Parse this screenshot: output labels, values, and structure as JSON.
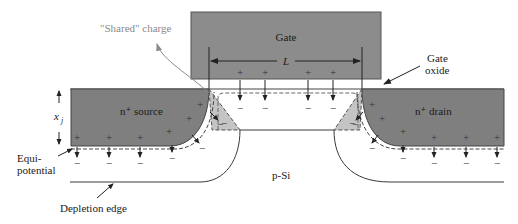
{
  "figure": {
    "colors": {
      "gate_fill": "#8c8c8c",
      "junction_fill": "#7f7f7f",
      "shared_fill": "#c4c4c4",
      "line": "#3a3a3a",
      "dashed": "#555555",
      "annotation_gray": "#8a8a8a"
    }
  },
  "labels": {
    "gate": "Gate",
    "channel_length": "L",
    "gate_oxide_line1": "Gate",
    "gate_oxide_line2": "oxide",
    "shared_charge": "\"Shared\" charge",
    "source": "n⁺ source",
    "drain": "n⁺ drain",
    "junction_depth": "x",
    "junction_depth_sub": "j",
    "equipotential_line1": "Equi-",
    "equipotential_line2": "potential",
    "substrate": "p-Si",
    "depletion_edge": "Depletion edge"
  },
  "symbols": {
    "plus": "+",
    "minus": "−"
  }
}
